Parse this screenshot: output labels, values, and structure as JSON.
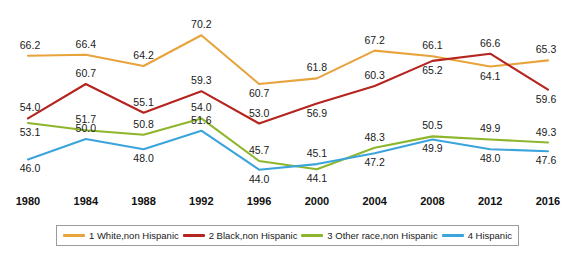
{
  "chart_data": {
    "type": "line",
    "title": "",
    "subtitle": "",
    "xlabel": "",
    "ylabel": "",
    "categories": [
      "1980",
      "1984",
      "1988",
      "1992",
      "1996",
      "2000",
      "2004",
      "2008",
      "2012",
      "2016"
    ],
    "x": [
      1980,
      1984,
      1988,
      1992,
      1996,
      2000,
      2004,
      2008,
      2012,
      2016
    ],
    "ylim": [
      42.0,
      72.0
    ],
    "grid": false,
    "legend_position": "bottom",
    "data_labels": true,
    "series": [
      {
        "name": "1 White,non Hispanic",
        "color": "#E8A33D",
        "values": [
          66.2,
          66.4,
          64.2,
          70.2,
          60.7,
          61.8,
          67.2,
          66.1,
          64.1,
          65.3
        ],
        "label_offsets": [
          -1,
          -1,
          -1,
          -1,
          1,
          -1,
          -1,
          -1,
          1,
          -1
        ]
      },
      {
        "name": "2 Black,non Hispanic",
        "color": "#B5241E",
        "values": [
          54.0,
          60.7,
          55.1,
          59.3,
          53.0,
          56.9,
          60.3,
          65.2,
          66.6,
          59.6
        ],
        "label_offsets": [
          -1,
          -1,
          -1,
          -1,
          -1,
          1,
          -1,
          1,
          -1,
          1
        ]
      },
      {
        "name": "3 Other race,non Hispanic",
        "color": "#8DB62C",
        "values": [
          53.1,
          51.7,
          50.8,
          54.0,
          45.7,
          44.1,
          48.3,
          50.5,
          49.9,
          49.3
        ],
        "label_offsets": [
          1,
          -1,
          -1,
          -1,
          -1,
          1,
          -1,
          -1,
          -1,
          -1
        ]
      },
      {
        "name": "4 Hispanic",
        "color": "#3BA4DB",
        "values": [
          46.0,
          50.0,
          48.0,
          51.6,
          44.0,
          45.1,
          47.2,
          49.9,
          48.0,
          47.6
        ],
        "label_offsets": [
          1,
          -1,
          1,
          -1,
          1,
          -1,
          1,
          1,
          1,
          1
        ]
      }
    ]
  },
  "legend": {
    "items": [
      {
        "label": "1 White,non Hispanic",
        "color": "#E8A33D"
      },
      {
        "label": "2 Black,non Hispanic",
        "color": "#B5241E"
      },
      {
        "label": "3 Other race,non Hispanic",
        "color": "#8DB62C"
      },
      {
        "label": "4 Hispanic",
        "color": "#3BA4DB"
      }
    ]
  }
}
